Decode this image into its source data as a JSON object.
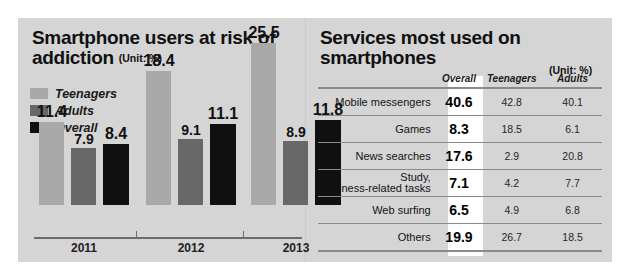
{
  "left": {
    "title": "Smartphone users at risk of addiction",
    "unit": "(Unit: %)",
    "legend": [
      {
        "label": "Teenagers",
        "color": "#a9a9a9"
      },
      {
        "label": "Adults",
        "color": "#686868"
      },
      {
        "label": "Overall",
        "color": "#101010"
      }
    ]
  },
  "right": {
    "title": "Services most used on smartphones",
    "unit": "(Unit: %)",
    "columns": [
      "",
      "Overall",
      "Teenagers",
      "Adults"
    ],
    "rows": [
      {
        "label": "Mobile messengers",
        "label2": "",
        "overall": "40.6",
        "teenagers": "42.8",
        "adults": "40.1"
      },
      {
        "label": "Games",
        "label2": "",
        "overall": "8.3",
        "teenagers": "18.5",
        "adults": "6.1"
      },
      {
        "label": "News searches",
        "label2": "",
        "overall": "17.6",
        "teenagers": "2.9",
        "adults": "20.8"
      },
      {
        "label": "Study,",
        "label2": "business-related tasks",
        "overall": "7.1",
        "teenagers": "4.2",
        "adults": "7.7"
      },
      {
        "label": "Web surfing",
        "label2": "",
        "overall": "6.5",
        "teenagers": "4.9",
        "adults": "6.8"
      },
      {
        "label": "Others",
        "label2": "",
        "overall": "19.9",
        "teenagers": "26.7",
        "adults": "18.5"
      }
    ]
  },
  "chart_data": {
    "type": "bar",
    "title": "Smartphone users at risk of addiction",
    "xlabel": "",
    "ylabel": "",
    "unit": "%",
    "grid": false,
    "legend_position": "top-left",
    "ylim": [
      0,
      27
    ],
    "categories": [
      "2011",
      "2012",
      "2013"
    ],
    "series": [
      {
        "name": "Teenagers",
        "color": "#a9a9a9",
        "values": [
          11.4,
          18.4,
          25.5
        ]
      },
      {
        "name": "Adults",
        "color": "#686868",
        "values": [
          7.9,
          9.1,
          8.9
        ]
      },
      {
        "name": "Overall",
        "color": "#101010",
        "values": [
          8.4,
          11.1,
          11.8
        ]
      }
    ],
    "labels": [
      "11.4",
      "7.9",
      "8.4",
      "18.4",
      "9.1",
      "11.1",
      "25.5",
      "8.9",
      "11.8"
    ]
  }
}
